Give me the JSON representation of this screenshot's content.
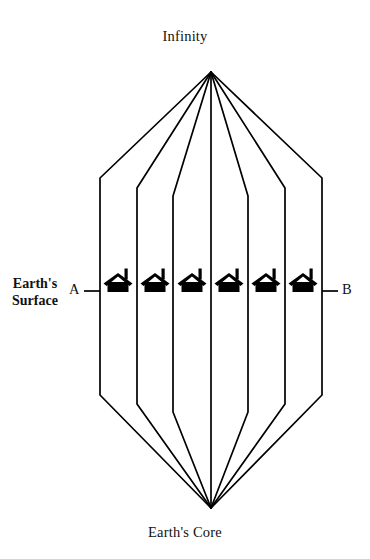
{
  "diagram": {
    "type": "conceptual-geometry-diagram",
    "title": "Infinity",
    "bottom_label": "Earth's Core",
    "left_label_line1": "Earth's",
    "left_label_line2": "Surface",
    "left_endpoint_label": "A",
    "right_endpoint_label": "B",
    "stroke_color": "#000000",
    "background_color": "#ffffff",
    "house_count": 6,
    "line_count": 7,
    "geometry": {
      "apex": {
        "x": 211,
        "y": 72
      },
      "nadir": {
        "x": 211,
        "y": 508
      },
      "surface_y": 291,
      "vertical_x": [
        100,
        137,
        173,
        211,
        248,
        285,
        322
      ],
      "top_bend_y": [
        178,
        188,
        196,
        72,
        196,
        188,
        178
      ],
      "bottom_bend_y": [
        395,
        404,
        412,
        508,
        412,
        404,
        395
      ],
      "a_tick_x0": 84,
      "a_tick_x1": 100,
      "b_tick_x0": 322,
      "b_tick_x1": 338
    },
    "houses": [
      {
        "index": 1,
        "center_x": 118
      },
      {
        "index": 2,
        "center_x": 155
      },
      {
        "index": 3,
        "center_x": 192
      },
      {
        "index": 4,
        "center_x": 229
      },
      {
        "index": 5,
        "center_x": 266
      },
      {
        "index": 6,
        "center_x": 303
      }
    ]
  }
}
